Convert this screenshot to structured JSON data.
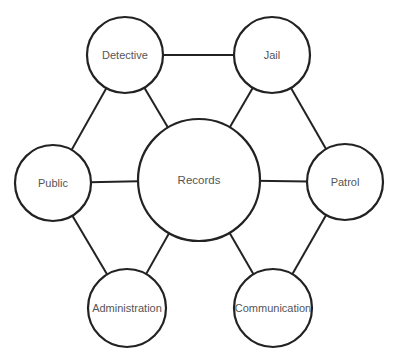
{
  "diagram": {
    "type": "network",
    "stroke_color": "#222222",
    "label_color": "#555555",
    "background": "#ffffff",
    "nodes": [
      {
        "id": "records",
        "label": "Records",
        "cx": 199,
        "cy": 180,
        "r": 61
      },
      {
        "id": "detective",
        "label": "Detective",
        "cx": 125,
        "cy": 55,
        "r": 38
      },
      {
        "id": "jail",
        "label": "Jail",
        "cx": 272,
        "cy": 55,
        "r": 38
      },
      {
        "id": "public",
        "label": "Public",
        "cx": 53,
        "cy": 183,
        "r": 38
      },
      {
        "id": "patrol",
        "label": "Patrol",
        "cx": 345,
        "cy": 182,
        "r": 38
      },
      {
        "id": "administration",
        "label": "Administration",
        "cx": 127,
        "cy": 308,
        "r": 39
      },
      {
        "id": "communication",
        "label": "Communication",
        "cx": 273,
        "cy": 308,
        "r": 39
      }
    ],
    "edges": [
      {
        "from": "detective",
        "to": "jail"
      },
      {
        "from": "detective",
        "to": "public"
      },
      {
        "from": "detective",
        "to": "records"
      },
      {
        "from": "jail",
        "to": "records"
      },
      {
        "from": "jail",
        "to": "patrol"
      },
      {
        "from": "public",
        "to": "records"
      },
      {
        "from": "records",
        "to": "patrol"
      },
      {
        "from": "public",
        "to": "administration"
      },
      {
        "from": "records",
        "to": "administration"
      },
      {
        "from": "records",
        "to": "communication"
      },
      {
        "from": "patrol",
        "to": "communication"
      }
    ]
  }
}
